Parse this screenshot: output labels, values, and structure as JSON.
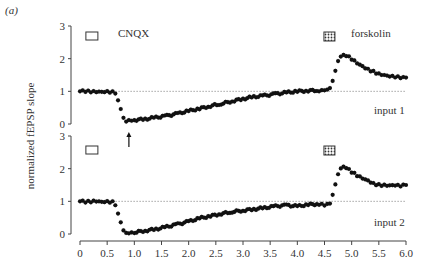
{
  "figure": {
    "panel_label": "(a)",
    "ylabel": "normalized fEPSP slope",
    "legend": {
      "cnqx_label": "CNQX",
      "forskolin_label": "forskolin"
    },
    "inputs": [
      "input 1",
      "input 2"
    ]
  },
  "chart_data": {
    "type": "scatter",
    "title": "",
    "xlabel": "",
    "ylabel": "normalized fEPSP slope",
    "xlim": [
      0,
      6.0
    ],
    "xticks": [
      "0",
      "0.5",
      "1.0",
      "1.5",
      "2.0",
      "2.5",
      "3.0",
      "3.5",
      "4.0",
      "4.5",
      "5.0",
      "5.5",
      "6.0"
    ],
    "panels": [
      {
        "name": "input 1",
        "ylim": [
          0,
          3
        ],
        "yticks": [
          "0",
          "1",
          "2",
          "3"
        ],
        "reference_line": 1,
        "annotations": [
          {
            "type": "open-box",
            "label": "CNQX",
            "x": 0.55
          },
          {
            "type": "hatched-box",
            "label": "forskolin",
            "x": 4.6
          },
          {
            "type": "arrow-up",
            "x": 0.9
          }
        ],
        "series": [
          {
            "name": "input 1",
            "x": [
              0.0,
              0.1,
              0.2,
              0.3,
              0.4,
              0.5,
              0.6,
              0.65,
              0.7,
              0.75,
              0.8,
              0.85,
              0.9,
              0.95,
              1.0,
              1.2,
              1.4,
              1.6,
              1.8,
              2.0,
              2.2,
              2.4,
              2.6,
              2.8,
              3.0,
              3.2,
              3.4,
              3.6,
              3.8,
              4.0,
              4.2,
              4.4,
              4.5,
              4.6,
              4.65,
              4.7,
              4.75,
              4.8,
              4.85,
              4.9,
              5.0,
              5.1,
              5.2,
              5.3,
              5.4,
              5.5,
              5.6,
              5.7,
              5.8,
              5.9,
              6.0
            ],
            "y": [
              1.0,
              1.0,
              1.0,
              1.0,
              1.0,
              1.0,
              0.98,
              0.9,
              0.7,
              0.45,
              0.2,
              0.1,
              0.15,
              0.12,
              0.12,
              0.15,
              0.2,
              0.25,
              0.32,
              0.4,
              0.47,
              0.55,
              0.62,
              0.7,
              0.77,
              0.83,
              0.87,
              0.92,
              0.96,
              1.0,
              1.02,
              1.03,
              1.05,
              1.1,
              1.3,
              1.6,
              1.9,
              2.05,
              2.12,
              2.1,
              2.0,
              1.88,
              1.78,
              1.68,
              1.6,
              1.52,
              1.48,
              1.45,
              1.44,
              1.43,
              1.42
            ]
          }
        ]
      },
      {
        "name": "input 2",
        "ylim": [
          0,
          3
        ],
        "yticks": [
          "0",
          "1",
          "2",
          "3"
        ],
        "reference_line": 1,
        "annotations": [
          {
            "type": "open-box",
            "x": 0.55
          },
          {
            "type": "hatched-box",
            "x": 4.6
          }
        ],
        "series": [
          {
            "name": "input 2",
            "x": [
              0.0,
              0.1,
              0.2,
              0.3,
              0.4,
              0.5,
              0.6,
              0.65,
              0.7,
              0.75,
              0.8,
              0.85,
              0.9,
              1.0,
              1.2,
              1.4,
              1.6,
              1.8,
              2.0,
              2.2,
              2.4,
              2.6,
              2.8,
              3.0,
              3.2,
              3.4,
              3.6,
              3.8,
              4.0,
              4.2,
              4.4,
              4.5,
              4.6,
              4.65,
              4.7,
              4.75,
              4.8,
              4.85,
              4.9,
              5.0,
              5.1,
              5.2,
              5.3,
              5.4,
              5.5,
              5.6,
              5.7,
              5.8,
              5.9,
              6.0
            ],
            "y": [
              1.0,
              0.98,
              1.0,
              1.02,
              1.0,
              1.0,
              0.98,
              0.85,
              0.6,
              0.35,
              0.12,
              0.06,
              0.05,
              0.05,
              0.1,
              0.15,
              0.22,
              0.3,
              0.38,
              0.48,
              0.55,
              0.62,
              0.68,
              0.72,
              0.76,
              0.8,
              0.85,
              0.88,
              0.85,
              0.9,
              0.92,
              0.9,
              0.95,
              1.2,
              1.5,
              1.8,
              1.98,
              2.05,
              2.02,
              1.9,
              1.8,
              1.72,
              1.65,
              1.55,
              1.5,
              1.48,
              1.47,
              1.48,
              1.47,
              1.5
            ]
          }
        ]
      }
    ],
    "grid": false,
    "legend_position": "inline-top"
  }
}
